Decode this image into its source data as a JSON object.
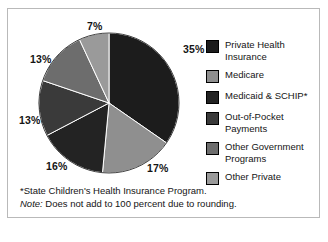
{
  "figure": {
    "border_color": "#b9b9b9",
    "background": "#ffffff"
  },
  "chart_data": {
    "type": "pie",
    "title": "",
    "subtitle": "",
    "xlabel": "",
    "ylabel": "",
    "legend_position": "right",
    "grid": false,
    "note": "Does not add to 100 percent due to rounding.",
    "categories": [
      "Private Health Insurance",
      "Medicare",
      "Medicaid & SCHIP*",
      "Out-of-Pocket Payments",
      "Other Government Programs",
      "Other Private"
    ],
    "values": [
      35,
      17,
      16,
      13,
      13,
      7
    ],
    "value_labels": [
      "35%",
      "17%",
      "16%",
      "13%",
      "13%",
      "7%"
    ],
    "colors": [
      "#1c1c1c",
      "#8f8f8f",
      "#232323",
      "#3a3a3a",
      "#6d6d6d",
      "#9a9a9a"
    ],
    "start_angle_deg": 0,
    "direction": "clockwise"
  },
  "pie_labels": {
    "private": "35%",
    "medicare": "17%",
    "medicaid": "16%",
    "out_of_pocket": "13%",
    "other_government": "13%",
    "other_private": "7%"
  },
  "legend": {
    "items": [
      {
        "label": "Private Health Insurance",
        "color": "#1c1c1c"
      },
      {
        "label": "Medicare",
        "color": "#8f8f8f"
      },
      {
        "label": "Medicaid & SCHIP*",
        "color": "#232323"
      },
      {
        "label": "Out-of-Pocket Payments",
        "color": "#3a3a3a"
      },
      {
        "label": "Other Government Programs",
        "color": "#6d6d6d"
      },
      {
        "label": "Other Private",
        "color": "#9a9a9a"
      }
    ]
  },
  "footnotes": {
    "asterisk": "*State Children's Health Insurance Program.",
    "note_prefix": "Note:",
    "note_text": " Does not add to 100 percent due to rounding."
  }
}
